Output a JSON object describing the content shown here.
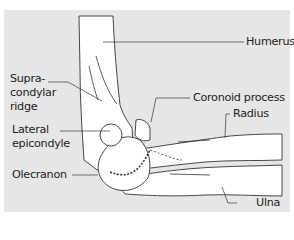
{
  "figure": {
    "background": "#e6e6e6",
    "labels": {
      "humerus": "Humerus",
      "supracondylar_ridge_1": "Supra-",
      "supracondylar_ridge_2": "condylar",
      "supracondylar_ridge_3": "ridge",
      "coronoid_process": "Coronoid process",
      "radius": "Radius",
      "lateral_epicondyle_1": "Lateral",
      "lateral_epicondyle_2": "epicondyle",
      "olecranon": "Olecranon",
      "ulna": "Ulna"
    }
  }
}
